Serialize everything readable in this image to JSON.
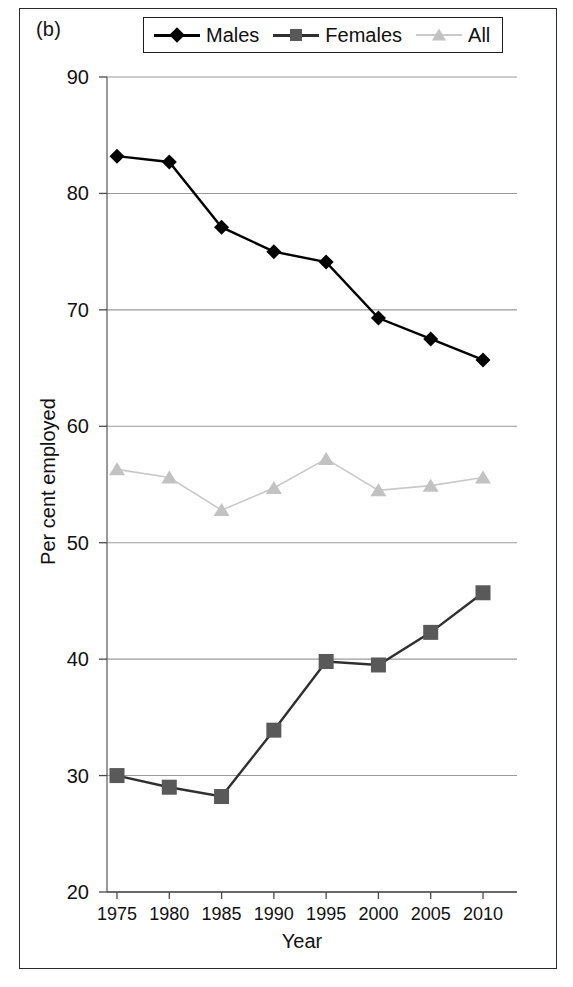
{
  "figure": {
    "panel_label": "(b)",
    "background": "#ffffff",
    "frame_color": "#2b2b2b"
  },
  "legend": {
    "position": "top",
    "items": [
      {
        "label": "Males",
        "marker": "diamond",
        "color": "#000000",
        "line_color": "#000000"
      },
      {
        "label": "Females",
        "marker": "square",
        "color": "#595959",
        "line_color": "#2f2f2f"
      },
      {
        "label": "All",
        "marker": "triangle",
        "color": "#c2c2c2",
        "line_color": "#c9c9c9"
      }
    ]
  },
  "chart_data": {
    "type": "line",
    "title": "",
    "xlabel": "Year",
    "ylabel": "Per cent employed",
    "categories": [
      1975,
      1980,
      1985,
      1990,
      1995,
      2000,
      2005,
      2010
    ],
    "xtick_labels": [
      "1975",
      "1980",
      "1985",
      "1990",
      "1995",
      "2000",
      "2005",
      "2010"
    ],
    "ytick_labels": [
      "90",
      "80",
      "70",
      "60",
      "50",
      "40",
      "30",
      "20"
    ],
    "yticks": [
      90,
      80,
      70,
      60,
      50,
      40,
      30,
      20
    ],
    "ylim": [
      20,
      90
    ],
    "grid": "horizontal",
    "series": [
      {
        "name": "Males",
        "marker": "diamond",
        "color": "#000000",
        "line_color": "#000000",
        "values": [
          83.2,
          82.7,
          77.1,
          75.0,
          74.1,
          69.3,
          67.5,
          65.7
        ]
      },
      {
        "name": "Females",
        "marker": "square",
        "color": "#595959",
        "line_color": "#2f2f2f",
        "values": [
          30.0,
          29.0,
          28.2,
          33.9,
          39.8,
          39.5,
          42.3,
          45.7
        ]
      },
      {
        "name": "All",
        "marker": "triangle",
        "color": "#c2c2c2",
        "line_color": "#c9c9c9",
        "values": [
          56.3,
          55.6,
          52.8,
          54.7,
          57.2,
          54.5,
          54.9,
          55.6
        ]
      }
    ]
  }
}
